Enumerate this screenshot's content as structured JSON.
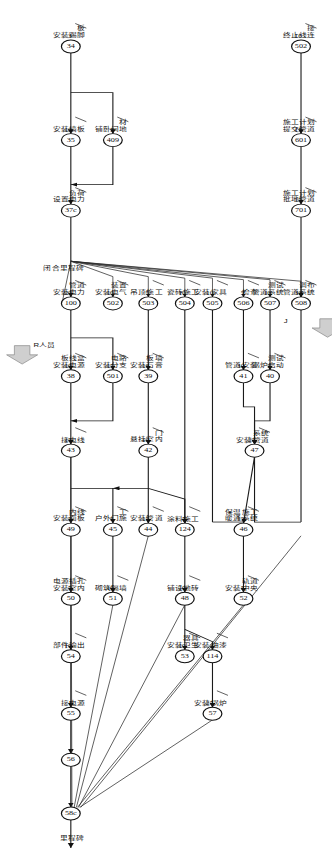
{
  "diagram": {
    "type": "cpm-network",
    "orientation": "rotated-90",
    "finish_label": "里程碑",
    "milestone_mid": "闭合里程碑",
    "annotations": [
      {
        "id": "ann-resource",
        "text": "R人员"
      },
      {
        "id": "ann-j",
        "text": "J"
      }
    ],
    "nodes": [
      {
        "id": "n34",
        "num": "34",
        "x": 60,
        "y": 236
      },
      {
        "id": "n35",
        "num": "35",
        "x": 182,
        "y": 236
      },
      {
        "id": "n409",
        "num": "409",
        "x": 182,
        "y": 198
      },
      {
        "id": "n37c",
        "num": "37c",
        "x": 274,
        "y": 236
      },
      {
        "id": "n100",
        "num": "100",
        "x": 395,
        "y": 236
      },
      {
        "id": "n38",
        "num": "38",
        "x": 490,
        "y": 236
      },
      {
        "id": "n501",
        "num": "501",
        "x": 490,
        "y": 198
      },
      {
        "id": "n43",
        "num": "43",
        "x": 587,
        "y": 236
      },
      {
        "id": "n49",
        "num": "49",
        "x": 690,
        "y": 236
      },
      {
        "id": "n50",
        "num": "50",
        "x": 780,
        "y": 236
      },
      {
        "id": "n502",
        "num": "502",
        "x": 395,
        "y": 198
      },
      {
        "id": "n45",
        "num": "45",
        "x": 690,
        "y": 198
      },
      {
        "id": "n51",
        "num": "51",
        "x": 780,
        "y": 198
      },
      {
        "id": "n503",
        "num": "503",
        "x": 395,
        "y": 166
      },
      {
        "id": "n39",
        "num": "39",
        "x": 490,
        "y": 166
      },
      {
        "id": "n42",
        "num": "42",
        "x": 587,
        "y": 166
      },
      {
        "id": "n44",
        "num": "44",
        "x": 690,
        "y": 166
      },
      {
        "id": "n504",
        "num": "504",
        "x": 395,
        "y": 133
      },
      {
        "id": "n124",
        "num": "124",
        "x": 690,
        "y": 133
      },
      {
        "id": "n48",
        "num": "48",
        "x": 780,
        "y": 133
      },
      {
        "id": "n53",
        "num": "53",
        "x": 855,
        "y": 133
      },
      {
        "id": "n505",
        "num": "505",
        "x": 395,
        "y": 108
      },
      {
        "id": "n114",
        "num": "114",
        "x": 855,
        "y": 108
      },
      {
        "id": "n57",
        "num": "57",
        "x": 930,
        "y": 108
      },
      {
        "id": "n506",
        "num": "506",
        "x": 395,
        "y": 80
      },
      {
        "id": "n41",
        "num": "41",
        "x": 490,
        "y": 80
      },
      {
        "id": "n507",
        "num": "507",
        "x": 395,
        "y": 56
      },
      {
        "id": "n40",
        "num": "40",
        "x": 490,
        "y": 56
      },
      {
        "id": "n47",
        "num": "47",
        "x": 587,
        "y": 70
      },
      {
        "id": "n46",
        "num": "46",
        "x": 690,
        "y": 80
      },
      {
        "id": "n52",
        "num": "52",
        "x": 780,
        "y": 80
      },
      {
        "id": "n508",
        "num": "508",
        "x": 395,
        "y": 28
      },
      {
        "id": "n701",
        "num": "701",
        "x": 274,
        "y": 28
      },
      {
        "id": "n601",
        "num": "601",
        "x": 182,
        "y": 28
      },
      {
        "id": "n502b",
        "num": "502",
        "x": 60,
        "y": 28
      },
      {
        "id": "n54",
        "num": "54",
        "x": 855,
        "y": 236
      },
      {
        "id": "n55",
        "num": "55",
        "x": 930,
        "y": 236
      },
      {
        "id": "n56",
        "num": "56",
        "x": 990,
        "y": 236
      },
      {
        "id": "n58c",
        "num": "58c",
        "x": 1060,
        "y": 236
      }
    ],
    "activities": [
      {
        "id": "a34",
        "label": "安装踢脚板",
        "duration": "3"
      },
      {
        "id": "a35",
        "label": "安装墙板",
        "duration": "10"
      },
      {
        "id": "a409",
        "label": "铺卧间地材",
        "duration": "5"
      },
      {
        "id": "a100",
        "label": "设置电力负荷",
        "duration": "2"
      },
      {
        "id": "a38",
        "label": "安装电力管道",
        "duration": "20"
      },
      {
        "id": "a501",
        "label": "安装电源板线盒",
        "duration": "10"
      },
      {
        "id": "a43",
        "label": "安装分支电路",
        "duration": "15"
      },
      {
        "id": "a49",
        "label": "接电线",
        "duration": "15"
      },
      {
        "id": "a50",
        "label": "安装面板内线",
        "duration": "5"
      },
      {
        "id": "a45",
        "label": "安装室内电源插孔",
        "duration": "5"
      },
      {
        "id": "a51",
        "label": "安装电气装置",
        "duration": "10"
      },
      {
        "id": "a502",
        "label": "户外门施工",
        "duration": "5"
      },
      {
        "id": "a503",
        "label": "砌筑隔墙",
        "duration": "10"
      },
      {
        "id": "a39",
        "label": "吊顶施工",
        "duration": "5"
      },
      {
        "id": "a42",
        "label": "安装石膏板墙",
        "duration": "10"
      },
      {
        "id": "a44",
        "label": "悬挂室内门",
        "duration": "10"
      },
      {
        "id": "a504",
        "label": "安装管道",
        "duration": "15"
      },
      {
        "id": "a124",
        "label": "瓷砖施工",
        "duration": "10"
      },
      {
        "id": "a48",
        "label": "涂料施工",
        "duration": "5"
      },
      {
        "id": "a53",
        "label": "铺设地砖",
        "duration": "10"
      },
      {
        "id": "a114",
        "label": "安装卫生器具",
        "duration": "10"
      },
      {
        "id": "a57",
        "label": "安装家具",
        "duration": "10"
      },
      {
        "id": "a505",
        "label": "安装油漆",
        "duration": "3"
      },
      {
        "id": "a506",
        "label": "安装锅炉",
        "duration": "25"
      },
      {
        "id": "a41",
        "label": "检查",
        "duration": "5"
      },
      {
        "id": "a507",
        "label": "管道安装",
        "duration": "30"
      },
      {
        "id": "a40",
        "label": "管道系统测试",
        "duration": "10"
      },
      {
        "id": "a47",
        "label": "锅炉启动测试",
        "duration": "5"
      },
      {
        "id": "a46",
        "label": "安装管道系统",
        "duration": "25"
      },
      {
        "id": "a52",
        "label": "暖通系统保温施工",
        "duration": "15"
      },
      {
        "id": "a508",
        "label": "安装中央轨道",
        "duration": "5"
      },
      {
        "id": "a701",
        "label": "管道系统调布",
        "duration": "30"
      },
      {
        "id": "a601",
        "label": "批地管道施工计划",
        "duration": "15"
      },
      {
        "id": "a502b",
        "label": "提交管道施工计划",
        "duration": "15"
      },
      {
        "id": "a54",
        "label": "终止线连接",
        "duration": "10"
      },
      {
        "id": "a55",
        "label": "部件输出",
        "duration": "10"
      },
      {
        "id": "a56",
        "label": "接电源",
        "duration": "1"
      }
    ]
  }
}
